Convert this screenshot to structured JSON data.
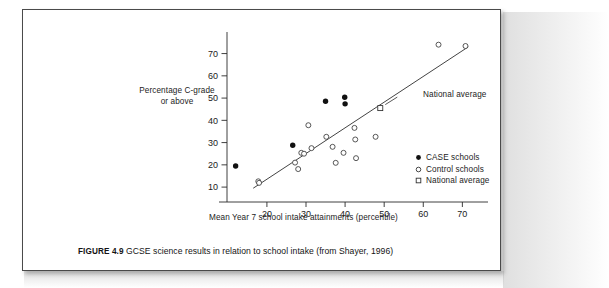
{
  "figure": {
    "caption_prefix": "FIGURE 4.9",
    "caption_text": "GCSE science results in relation to school intake (from Shayer, 1996)"
  },
  "annotations": [
    {
      "name": "national-average",
      "label": "National average",
      "x": 49,
      "y": 45.5
    }
  ],
  "legend": {
    "position": "bottom-right",
    "items": [
      {
        "marker": "filled-circle",
        "label": "CASE schools"
      },
      {
        "marker": "open-circle",
        "label": "Control schools"
      },
      {
        "marker": "open-square",
        "label": "National average"
      }
    ]
  },
  "chart_data": {
    "type": "scatter",
    "title": "",
    "xlabel": "Mean Year 7 school intake attainments (percentile)",
    "ylabel": "Percentage C-grade or above",
    "ylabel_line1": "Percentage C-grade",
    "ylabel_line2": "or above",
    "xlim": [
      8,
      74
    ],
    "ylim": [
      6,
      77
    ],
    "xticks": [
      20,
      30,
      40,
      50,
      60,
      70
    ],
    "yticks": [
      10,
      20,
      30,
      40,
      50,
      60,
      70
    ],
    "grid": false,
    "trendline": {
      "x0": 16.5,
      "y0": 9.5,
      "x1": 71.5,
      "y1": 73.0
    },
    "series": [
      {
        "name": "CASE schools",
        "marker": "filled-circle",
        "color": "#111111",
        "points": [
          [
            12.0,
            19.5
          ],
          [
            26.6,
            28.8
          ],
          [
            35.0,
            48.6
          ],
          [
            39.9,
            50.4
          ],
          [
            40.0,
            47.4
          ]
        ]
      },
      {
        "name": "Control schools",
        "marker": "open-circle",
        "color": "#3a3a3a",
        "points": [
          [
            17.8,
            12.6
          ],
          [
            18.0,
            11.9
          ],
          [
            27.2,
            21.0
          ],
          [
            28.0,
            18.1
          ],
          [
            28.8,
            25.4
          ],
          [
            29.5,
            25.0
          ],
          [
            30.6,
            37.8
          ],
          [
            31.4,
            27.5
          ],
          [
            35.2,
            32.6
          ],
          [
            36.8,
            28.1
          ],
          [
            37.6,
            20.9
          ],
          [
            39.6,
            25.4
          ],
          [
            42.4,
            36.6
          ],
          [
            42.6,
            31.4
          ],
          [
            42.8,
            23.0
          ],
          [
            47.8,
            32.6
          ],
          [
            63.9,
            74.0
          ],
          [
            70.8,
            73.4
          ]
        ]
      },
      {
        "name": "National average",
        "marker": "open-square",
        "color": "#2b2b2b",
        "points": [
          [
            49.0,
            45.5
          ]
        ]
      }
    ]
  }
}
